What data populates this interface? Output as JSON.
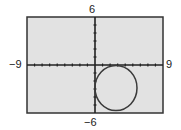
{
  "chart_data": {
    "type": "line",
    "title": "",
    "series": [
      {
        "name": "circle",
        "equation": "(x - 3)^2 + (y + 3)^2 = 9",
        "center": [
          3,
          -3
        ],
        "radius": 3,
        "color": "#3a3a3a"
      }
    ],
    "xlim": [
      -9,
      9
    ],
    "ylim": [
      -6,
      6
    ],
    "xscale": 1,
    "yscale": 1,
    "grid": false,
    "window_labels": {
      "xmin": "−9",
      "xmax": "9",
      "ymin": "−6",
      "ymax": "6"
    },
    "xlabel": "",
    "ylabel": "",
    "colors": {
      "plot_background": "#e2e2e2",
      "frame": "#333333",
      "axes": "#222222"
    }
  }
}
